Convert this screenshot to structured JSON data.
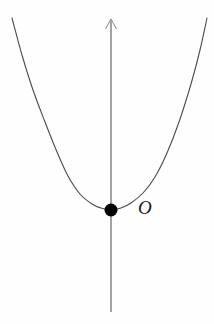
{
  "figure": {
    "name": "parabola-with-vertex-at-origin",
    "background_color": "#fefefe",
    "width": 214,
    "height": 324,
    "labels": {
      "origin": "O"
    },
    "icons": {
      "axis_arrow": "arrow-up-icon",
      "vertex": "filled-point-icon"
    },
    "colors": {
      "curve": "#4a4a52",
      "axis": "#8a8a90",
      "point": "#000000",
      "label": "#1a1a1a"
    }
  },
  "chart_data": {
    "type": "line",
    "title": "",
    "subtitle": "",
    "xlabel": "",
    "ylabel": "",
    "grid": false,
    "legend": false,
    "annotations": [
      {
        "text": "O",
        "meaning": "origin-label",
        "pixel_x": 146,
        "pixel_y": 208,
        "style": "italic-serif"
      }
    ],
    "axes": [
      {
        "name": "y-axis",
        "orientation": "vertical",
        "pixel_x": 111,
        "pixel_y_start": 312,
        "pixel_y_end": 18,
        "arrow_at": "top",
        "color": "#8a8a90"
      }
    ],
    "points": [
      {
        "name": "vertex",
        "label": "O",
        "x": 0,
        "y": 0,
        "pixel_x": 111,
        "pixel_y": 210,
        "marker": "filled-circle",
        "radius_px": 6.5,
        "color": "#000000"
      }
    ],
    "series": [
      {
        "name": "parabola",
        "equation": "y = a*x^2, vertex at origin, opens upward",
        "color": "#4a4a52",
        "line_width": 1.1,
        "vertex_pixel": [
          111,
          210
        ],
        "pixel_path": [
          [
            12,
            18
          ],
          [
            22,
            55
          ],
          [
            33,
            90
          ],
          [
            45,
            122
          ],
          [
            57,
            152
          ],
          [
            68,
            176
          ],
          [
            80,
            194
          ],
          [
            92,
            204
          ],
          [
            101,
            208
          ],
          [
            111,
            210
          ],
          [
            121,
            208
          ],
          [
            131,
            203
          ],
          [
            143,
            193
          ],
          [
            155,
            177
          ],
          [
            167,
            153
          ],
          [
            179,
            122
          ],
          [
            191,
            84
          ],
          [
            200,
            50
          ],
          [
            207,
            18
          ]
        ]
      }
    ],
    "xlim": [
      12,
      207
    ],
    "ylim": [
      18,
      312
    ]
  }
}
